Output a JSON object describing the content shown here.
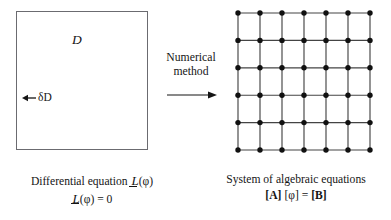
{
  "figure": {
    "width": 391,
    "height": 220,
    "background": "#ffffff",
    "ink_color": "#151515",
    "box_stroke": "#6b6b70"
  },
  "left_panel": {
    "name": "continuous-domain",
    "domain_label": "D",
    "boundary_label": "δD",
    "boundary_arrow_direction": "left",
    "box": {
      "x": 16,
      "y": 11,
      "width": 132,
      "height": 139
    }
  },
  "transform": {
    "caption_line1": "Numerical",
    "caption_line2": "method",
    "arrow_direction": "right"
  },
  "right_panel": {
    "name": "discretized-mesh",
    "grid": {
      "columns": 7,
      "rows": 6,
      "node_count": 42,
      "node_color": "#111111",
      "line_color": "#444444",
      "x_start": 238,
      "y_start": 13,
      "x_spacing": 22,
      "y_spacing": 27.4
    }
  },
  "captions": {
    "left": {
      "line1_prefix": "Differential equation ",
      "line1_operator": "L",
      "line1_argument": "(φ)",
      "line2_operator": "L",
      "line2_argument": "(φ) = 0"
    },
    "right": {
      "line1": "System of algebraic equations",
      "line2_a": "[A]",
      "line2_phi": "[φ]",
      "line2_eq": "=",
      "line2_b": "[B]"
    }
  }
}
